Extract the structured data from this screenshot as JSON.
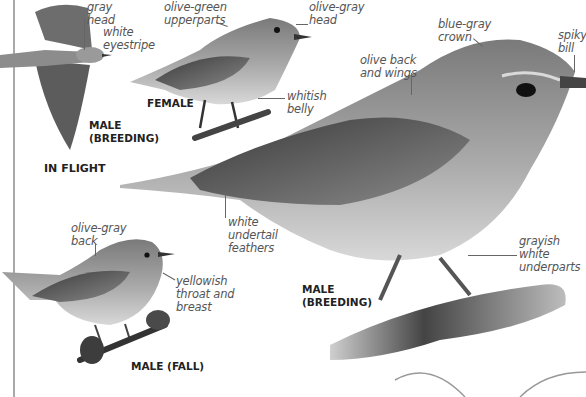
{
  "page": {
    "colors": {
      "background": "#ffffff",
      "label_text": "#555555",
      "caption_text": "#222222",
      "rule": "#a9a9a9"
    }
  },
  "figures": {
    "in_flight": {
      "caption": "IN FLIGHT",
      "sub_caption_line1": "MALE",
      "sub_caption_line2": "(BREEDING)",
      "labels": [
        {
          "line1": "gray",
          "line2": "head"
        },
        {
          "line1": "white",
          "line2": "eyestripe"
        }
      ]
    },
    "female": {
      "caption": "FEMALE",
      "labels": [
        {
          "line1": "olive-green",
          "line2": "upperparts"
        },
        {
          "line1": "olive-gray",
          "line2": "head"
        },
        {
          "line1": "whitish",
          "line2": "belly"
        }
      ]
    },
    "male_breeding": {
      "caption_line1": "MALE",
      "caption_line2": "(BREEDING)",
      "labels": [
        {
          "line1": "blue-gray",
          "line2": "crown"
        },
        {
          "line1": "spiky",
          "line2": "bill"
        },
        {
          "line1": "olive back",
          "line2": "and wings"
        },
        {
          "line1": "white",
          "line2": "undertail",
          "line3": "feathers"
        },
        {
          "line1": "grayish white",
          "line2": "underparts"
        }
      ]
    },
    "male_fall": {
      "caption": "MALE (FALL)",
      "labels": [
        {
          "line1": "olive-gray",
          "line2": "back"
        },
        {
          "line1": "yellowish",
          "line2": "throat and",
          "line3": "breast"
        }
      ]
    }
  }
}
